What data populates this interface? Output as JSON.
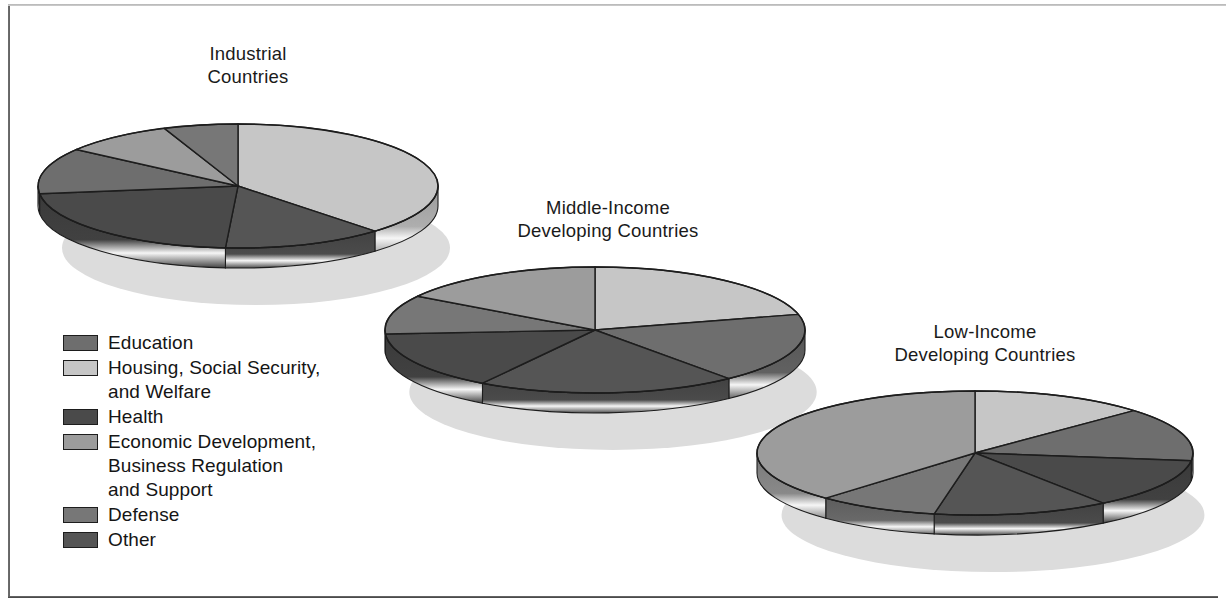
{
  "figure": {
    "background_color": "#ffffff",
    "frame_color": "#3d3d3d"
  },
  "legend": {
    "name": "legend",
    "items": [
      {
        "label": "Education",
        "color": "#6e6e6e"
      },
      {
        "label": "Housing, Social Security,\nand Welfare",
        "color": "#c6c6c6"
      },
      {
        "label": "Health",
        "color": "#4a4a4a"
      },
      {
        "label": "Economic Development,\nBusiness Regulation\nand Support",
        "color": "#9c9c9c"
      },
      {
        "label": "Defense",
        "color": "#777777"
      },
      {
        "label": "Other",
        "color": "#555555"
      }
    ]
  },
  "chart_data": {
    "type": "pie",
    "legend_position": "left-bottom",
    "categories": [
      "Education",
      "Housing, Social Security, and Welfare",
      "Health",
      "Economic Development, Business Regulation and Support",
      "Defense",
      "Other"
    ],
    "colors": [
      "#6e6e6e",
      "#c6c6c6",
      "#4a4a4a",
      "#9c9c9c",
      "#777777",
      "#555555"
    ],
    "charts": [
      {
        "name": "industrial-countries-pie",
        "title": "Industrial\nCountries",
        "title_x": 248,
        "title_y": 42,
        "cx": 238,
        "cy": 186,
        "rx": 200,
        "ry": 62,
        "depth": 20,
        "shadow_dx": 18,
        "shadow_dy": 62,
        "slices": [
          {
            "category": "Housing, Social Security, and Welfare",
            "value": 38,
            "color": "#c6c6c6"
          },
          {
            "category": "Other",
            "value": 13,
            "color": "#555555"
          },
          {
            "category": "Health",
            "value": 22,
            "color": "#4a4a4a"
          },
          {
            "category": "Education",
            "value": 12,
            "color": "#6e6e6e"
          },
          {
            "category": "Economic Development, Business Regulation and Support",
            "value": 9,
            "color": "#9c9c9c"
          },
          {
            "category": "Defense",
            "value": 6,
            "color": "#777777"
          }
        ]
      },
      {
        "name": "middle-income-developing-countries-pie",
        "title": "Middle-Income\nDeveloping Countries",
        "title_x": 608,
        "title_y": 196,
        "cx": 595,
        "cy": 330,
        "rx": 210,
        "ry": 63,
        "depth": 20,
        "shadow_dx": 18,
        "shadow_dy": 62,
        "slices": [
          {
            "category": "Housing, Social Security, and Welfare",
            "value": 21,
            "color": "#c6c6c6"
          },
          {
            "category": "Education",
            "value": 18,
            "color": "#6e6e6e"
          },
          {
            "category": "Other",
            "value": 20,
            "color": "#555555"
          },
          {
            "category": "Health",
            "value": 15,
            "color": "#4a4a4a"
          },
          {
            "category": "Defense",
            "value": 10,
            "color": "#777777"
          },
          {
            "category": "Economic Development, Business Regulation and Support",
            "value": 16,
            "color": "#9c9c9c"
          }
        ]
      },
      {
        "name": "low-income-developing-countries-pie",
        "title": "Low-Income\nDeveloping Countries",
        "title_x": 985,
        "title_y": 320,
        "cx": 975,
        "cy": 453,
        "rx": 218,
        "ry": 62,
        "depth": 20,
        "shadow_dx": 18,
        "shadow_dy": 62,
        "slices": [
          {
            "category": "Housing, Social Security, and Welfare",
            "value": 13,
            "color": "#c6c6c6"
          },
          {
            "category": "Education",
            "value": 14,
            "color": "#6e6e6e"
          },
          {
            "category": "Health",
            "value": 13,
            "color": "#4a4a4a"
          },
          {
            "category": "Other",
            "value": 13,
            "color": "#555555"
          },
          {
            "category": "Defense",
            "value": 9,
            "color": "#777777"
          },
          {
            "category": "Economic Development, Business Regulation and Support",
            "value": 38,
            "color": "#9c9c9c"
          }
        ]
      }
    ]
  }
}
